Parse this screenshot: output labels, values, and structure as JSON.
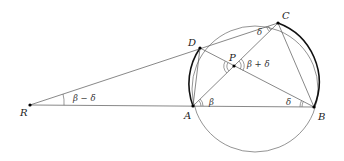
{
  "diagram": {
    "type": "geometry",
    "points": {
      "R": {
        "label": "R",
        "x": 30,
        "y": 105
      },
      "A": {
        "label": "A",
        "x": 193,
        "y": 106
      },
      "B": {
        "label": "B",
        "x": 314,
        "y": 107
      },
      "C": {
        "label": "C",
        "x": 278,
        "y": 23
      },
      "D": {
        "label": "D",
        "x": 200,
        "y": 48
      },
      "P": {
        "label": "P",
        "x": 234,
        "y": 66
      }
    },
    "circle": {
      "cx": 255,
      "cy": 89,
      "r": 63
    },
    "angles": {
      "R": "β − δ",
      "A": "β",
      "B": "δ",
      "C": "δ",
      "P": "β + δ"
    },
    "colors": {
      "line": "#555555",
      "thick_arc": "#111111",
      "point": "#000000"
    }
  }
}
